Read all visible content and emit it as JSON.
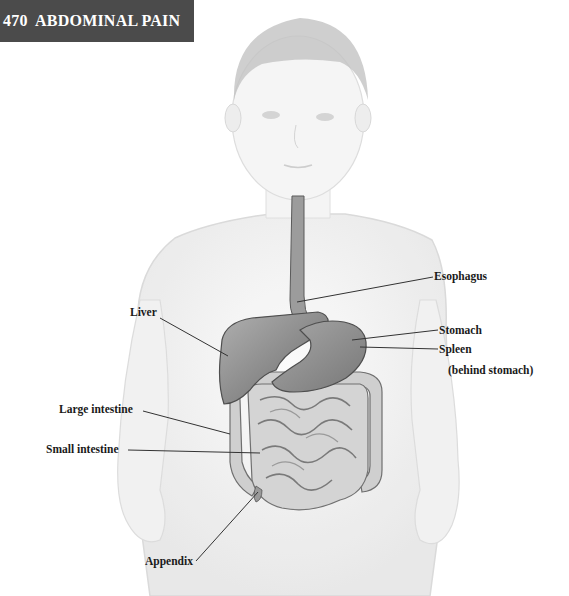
{
  "header": {
    "page_number": "470",
    "title": "ABDOMINAL PAIN",
    "full_label": "470  ABDOMINAL PAIN",
    "background_color": "#4b4b4b",
    "text_color": "#ffffff"
  },
  "figure": {
    "labels": {
      "esophagus": "Esophagus",
      "liver": "Liver",
      "stomach": "Stomach",
      "spleen": "Spleen",
      "spleen_note": "(behind stomach)",
      "large_intestine": "Large intestine",
      "small_intestine": "Small intestine",
      "appendix": "Appendix"
    },
    "colors": {
      "body_outline": "#cfcfcf",
      "body_fill": "#f2f2f2",
      "hair": "#b8b8b8",
      "organ_fill": "#9a9a9a",
      "organ_dark": "#6e6e6e",
      "intestine_fill": "#c8c8c8",
      "leader_line": "#333333"
    }
  }
}
